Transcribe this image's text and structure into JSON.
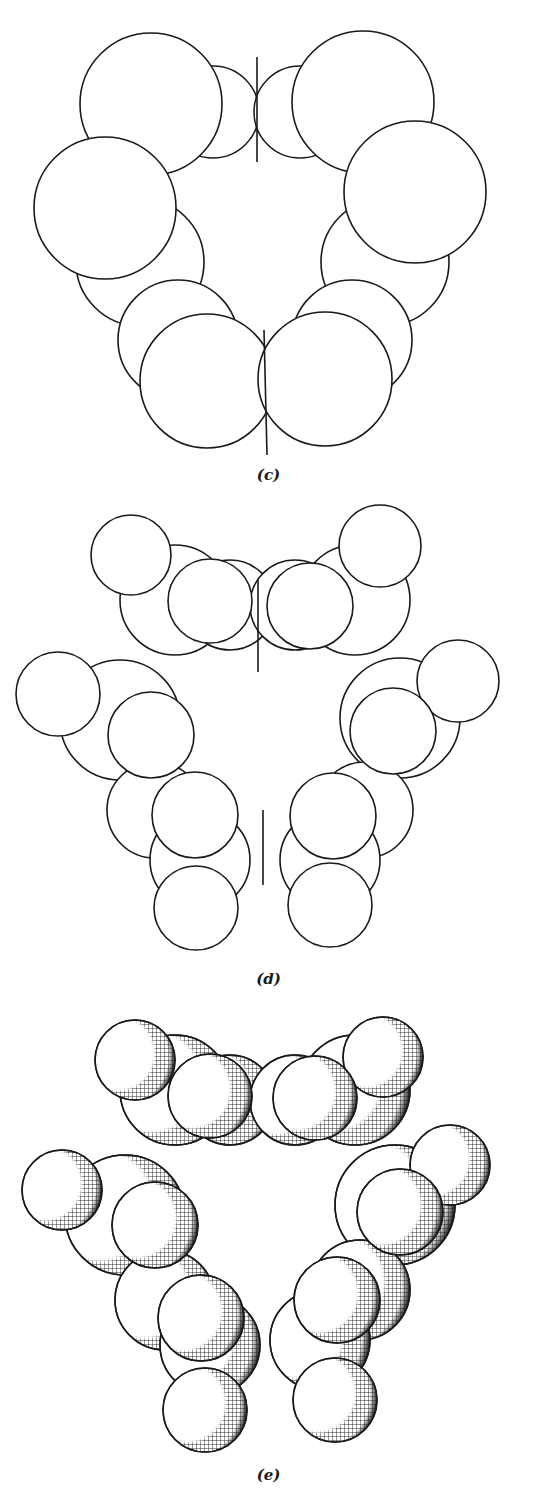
{
  "figure": {
    "panels": [
      {
        "id": "c",
        "label": "(c)",
        "style": "outline",
        "description": "Space-filling outline model, large atoms only"
      },
      {
        "id": "d",
        "label": "(d)",
        "style": "outline",
        "description": "Space-filling outline model with hydrogen atoms"
      },
      {
        "id": "e",
        "label": "(e)",
        "style": "hatched",
        "description": "Space-filling model with crosshatch shading"
      }
    ]
  },
  "colors": {
    "ink": "#1a1a1a",
    "paper": "#ffffff"
  }
}
